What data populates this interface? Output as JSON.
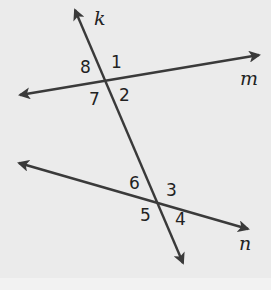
{
  "diagram": {
    "type": "transversal-lines",
    "colors": {
      "line": "#3a3a3a",
      "background": "#ebebeb",
      "text": "#222222"
    },
    "lines": [
      {
        "name": "k",
        "role": "transversal",
        "x1": 75,
        "y1": 10,
        "x2": 183,
        "y2": 263
      },
      {
        "name": "m",
        "x1": 20,
        "y1": 95,
        "x2": 259,
        "y2": 55
      },
      {
        "name": "n",
        "x1": 19,
        "y1": 163,
        "x2": 248,
        "y2": 229
      }
    ],
    "line_labels": {
      "k": "k",
      "m": "m",
      "n": "n"
    },
    "angle_labels": {
      "a1": "1",
      "a2": "2",
      "a3": "3",
      "a4": "4",
      "a5": "5",
      "a6": "6",
      "a7": "7",
      "a8": "8"
    }
  }
}
